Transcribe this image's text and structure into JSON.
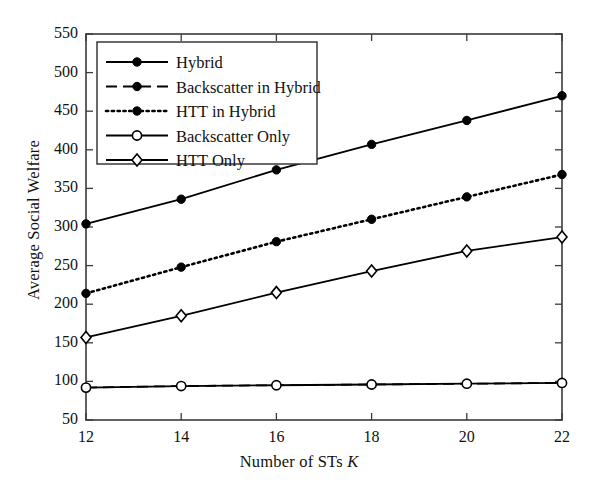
{
  "chart_data": {
    "type": "line",
    "title": "",
    "xlabel": "Number of STs K",
    "ylabel": "Average Social Welfare",
    "x": [
      12,
      14,
      16,
      18,
      20,
      22
    ],
    "xlim": [
      12,
      22
    ],
    "ylim": [
      50,
      550
    ],
    "xticks": [
      12,
      14,
      16,
      18,
      20,
      22
    ],
    "yticks": [
      50,
      100,
      150,
      200,
      250,
      300,
      350,
      400,
      450,
      500,
      550
    ],
    "grid": false,
    "legend_position": "upper-left",
    "series": [
      {
        "name": "Hybrid",
        "values": [
          304,
          336,
          374,
          407,
          438,
          470
        ],
        "line_style": "solid",
        "marker": "filled-circle",
        "color": "#000000"
      },
      {
        "name": "Backscatter in Hybrid",
        "values": [
          92,
          94,
          95,
          96,
          97,
          98
        ],
        "line_style": "dashed",
        "marker": "filled-circle",
        "color": "#000000"
      },
      {
        "name": "HTT in Hybrid",
        "values": [
          214,
          248,
          281,
          310,
          339,
          368
        ],
        "line_style": "dotted",
        "marker": "filled-circle",
        "color": "#000000"
      },
      {
        "name": "Backscatter Only",
        "values": [
          92,
          94,
          95,
          96,
          97,
          98
        ],
        "line_style": "solid",
        "marker": "open-circle",
        "color": "#000000"
      },
      {
        "name": "HTT Only",
        "values": [
          157,
          185,
          215,
          243,
          269,
          287
        ],
        "line_style": "solid",
        "marker": "open-diamond",
        "color": "#000000"
      }
    ]
  },
  "axes": {
    "xlabel_prefix": "Number of STs ",
    "xlabel_symbol": "K",
    "ylabel": "Average Social Welfare",
    "ytick_labels": [
      "550",
      "500",
      "450",
      "400",
      "350",
      "300",
      "250",
      "200",
      "150",
      "100",
      "50"
    ],
    "xtick_labels": [
      "12",
      "14",
      "16",
      "18",
      "20",
      "22"
    ]
  },
  "legend": {
    "items": [
      {
        "label": "Hybrid"
      },
      {
        "label": "Backscatter in Hybrid"
      },
      {
        "label": "HTT in Hybrid"
      },
      {
        "label": "Backscatter Only"
      },
      {
        "label": "HTT Only"
      }
    ]
  }
}
